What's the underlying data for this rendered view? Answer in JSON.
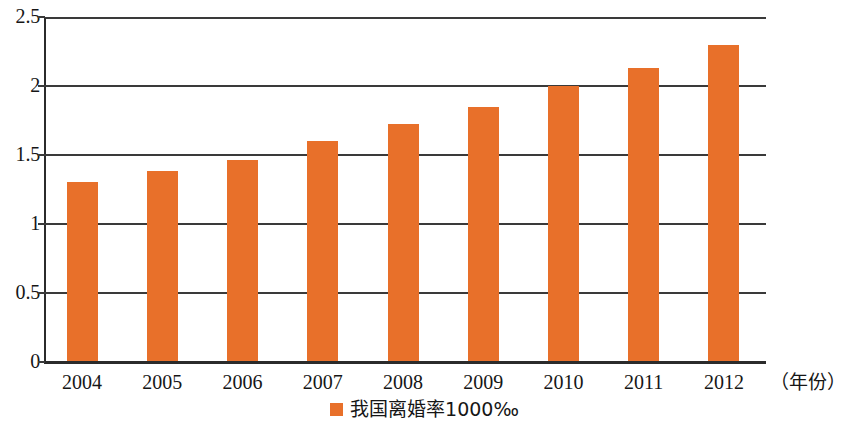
{
  "chart_data": {
    "type": "bar",
    "title": "",
    "subtitle": "",
    "xlabel": "（年份）",
    "ylabel": "",
    "categories": [
      "2004",
      "2005",
      "2006",
      "2007",
      "2008",
      "2009",
      "2010",
      "2011",
      "2012"
    ],
    "values": [
      1.3,
      1.38,
      1.46,
      1.6,
      1.72,
      1.85,
      2.0,
      2.13,
      2.3
    ],
    "series": [
      {
        "name": "我国离婚率1000‰",
        "color": "#e8702a",
        "values": [
          1.3,
          1.38,
          1.46,
          1.6,
          1.72,
          1.85,
          2.0,
          2.13,
          2.3
        ]
      }
    ],
    "ylim": [
      0,
      2.5
    ],
    "yticks": [
      "0",
      "0.5",
      "1",
      "1.5",
      "2",
      "2.5"
    ],
    "ytick_values": [
      0,
      0.5,
      1,
      1.5,
      2,
      2.5
    ],
    "grid": "horizontal",
    "legend_position": "bottom-center",
    "legend_entries": [
      "我国离婚率1000‰"
    ],
    "annotations": []
  },
  "axes": {
    "x_unit_label": "（年份）"
  },
  "legend": {
    "label": "我国离婚率1000‰",
    "swatch_color": "#e8702a"
  },
  "colors": {
    "bar": "#e8702a",
    "axis": "#2b2b2b",
    "grid": "#3a3a3a",
    "text": "#161616",
    "background": "#ffffff"
  }
}
